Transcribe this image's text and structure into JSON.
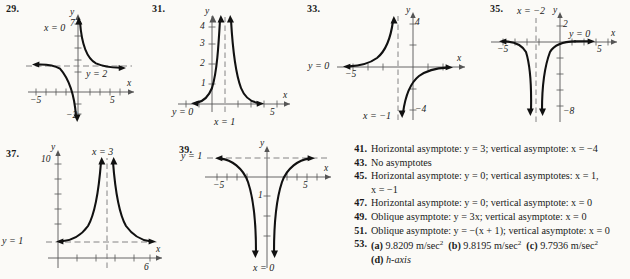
{
  "page": {
    "background_color": "#fbfaf7",
    "ink_color": "#1a1a1a"
  },
  "figures": [
    {
      "number": "29.",
      "vertical_asymptote_label": "x = 0",
      "horizontal_asymptote_label": "y = 2",
      "y_axis_label": "y",
      "x_axis_label": "x",
      "y_top_tick": "7",
      "y_bottom_tick": "−2",
      "x_left_tick": "−5",
      "x_right_tick": "5"
    },
    {
      "number": "31.",
      "vertical_asymptote_label": "x = 1",
      "horizontal_asymptote_label": "y = 0",
      "y_axis_label": "y",
      "x_axis_label": "x",
      "y_ticks": [
        "1",
        "2",
        "3",
        "4"
      ],
      "x_right_tick": "5"
    },
    {
      "number": "33.",
      "vertical_asymptote_label": "x = −1",
      "horizontal_asymptote_label": "y = 0",
      "y_axis_label": "y",
      "x_axis_label": "x",
      "y_top_tick": "4",
      "y_bottom_tick": "−4",
      "x_left_tick": "−5"
    },
    {
      "number": "35.",
      "vertical_asymptote_label": "x = −2",
      "horizontal_asymptote_label": "y = 0",
      "y_axis_label": "y",
      "x_axis_label": "x",
      "y_top_tick": "2",
      "y_bottom_tick": "−8",
      "x_left_tick": "−5",
      "x_right_tick": "5"
    },
    {
      "number": "37.",
      "vertical_asymptote_label": "x = 3",
      "horizontal_asymptote_label": "y = 1",
      "y_axis_label": "y",
      "x_axis_label": "x",
      "y_top_tick": "10",
      "x_right_tick": "6"
    },
    {
      "number": "39.",
      "vertical_asymptote_label": "x = 0",
      "horizontal_asymptote_label": "y = 1",
      "y_axis_label": "y",
      "x_axis_label": "x",
      "y_tick": "1",
      "x_left_tick": "−5",
      "x_right_tick": "5"
    }
  ],
  "answers": [
    {
      "number": "41.",
      "text": "Horizontal asymptote: y = 3; vertical asymptote: x = −4"
    },
    {
      "number": "43.",
      "text": "No asymptotes"
    },
    {
      "number": "45.",
      "text": "Horizontal asymptote: y = 0; vertical asymptotes: x = 1,",
      "continuation": "x = −1"
    },
    {
      "number": "47.",
      "text": "Horizontal asymptote: y = 0; vertical asymptote: x = 0"
    },
    {
      "number": "49.",
      "text": "Oblique asymptote: y = 3x; vertical asymptote: x = 0"
    },
    {
      "number": "51.",
      "text": "Oblique asymptote: y = −(x + 1); vertical asymptote: x = 0"
    },
    {
      "number": "53.",
      "parts": [
        {
          "label": "(a)",
          "value": "9.8209 m/sec",
          "exponent": "2"
        },
        {
          "label": "(b)",
          "value": "9.8195 m/sec",
          "exponent": "2"
        },
        {
          "label": "(c)",
          "value": "9.7936 m/sec",
          "exponent": "2"
        }
      ],
      "continuation_label": "(d)",
      "continuation_value": "h-axis"
    }
  ]
}
